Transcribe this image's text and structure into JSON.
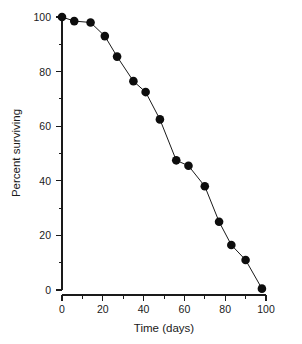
{
  "chart_data": {
    "type": "line",
    "title": "",
    "subtitle": "",
    "xlabel": "Time (days)",
    "ylabel": "Percent surviving",
    "xlim": [
      0,
      100
    ],
    "ylim": [
      0,
      100
    ],
    "grid": false,
    "legend": null,
    "legend_position": "none",
    "marker": "filled-circle",
    "marker_color": "#0d0d0d",
    "line_color": "#1a1a1a",
    "x_major_ticks": [
      0,
      20,
      40,
      60,
      80,
      100
    ],
    "x_minor_ticks": [
      10,
      30,
      50,
      70,
      90
    ],
    "y_major_ticks": [
      0,
      20,
      40,
      60,
      80,
      100
    ],
    "y_minor_ticks": [
      10,
      30,
      50,
      70,
      90
    ],
    "x_tick_labels": [
      "0",
      "20",
      "40",
      "60",
      "80",
      "100"
    ],
    "y_tick_labels": [
      "0",
      "20",
      "40",
      "60",
      "80",
      "100"
    ],
    "series": [
      {
        "name": "Percent surviving",
        "x": [
          0,
          6,
          14,
          21,
          27,
          35,
          41,
          48,
          56,
          62,
          70,
          77,
          83,
          90,
          98
        ],
        "y": [
          100,
          98.5,
          98,
          93,
          85.5,
          76.5,
          72.5,
          62.5,
          47.5,
          45.5,
          38,
          25,
          16.5,
          11,
          0.5
        ]
      }
    ]
  },
  "axes": {
    "xlabel": "Time (days)",
    "ylabel": "Percent surviving"
  },
  "background_color": "#ffffff"
}
